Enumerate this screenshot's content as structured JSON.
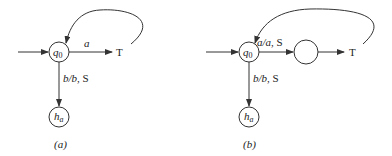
{
  "diagrams": [
    {
      "id": "a",
      "caption": "(a)",
      "nodes": {
        "start": {
          "label_main": "q",
          "label_sub": "0"
        },
        "halt": {
          "label_main": "h",
          "label_sub": "a"
        },
        "target": {
          "label": "T"
        }
      },
      "edges": {
        "start_to_target": {
          "label": "a"
        },
        "start_to_halt": {
          "label_italic": "b/b",
          "label_plain": ", S"
        }
      }
    },
    {
      "id": "b",
      "caption": "(b)",
      "nodes": {
        "start": {
          "label_main": "q",
          "label_sub": "0"
        },
        "halt": {
          "label_main": "h",
          "label_sub": "a"
        },
        "middle": {
          "label": ""
        },
        "target": {
          "label": "T"
        }
      },
      "edges": {
        "start_to_middle": {
          "label_italic": "a/a",
          "label_plain": ", S"
        },
        "start_to_halt": {
          "label_italic": "b/b",
          "label_plain": ", S"
        },
        "middle_to_target": {
          "label": ""
        }
      }
    }
  ],
  "colors": {
    "stroke": "#333333",
    "text": "#222222",
    "background": "#ffffff"
  }
}
